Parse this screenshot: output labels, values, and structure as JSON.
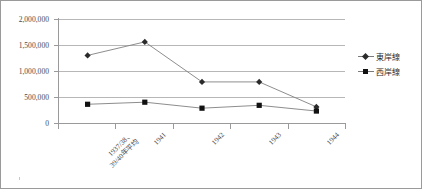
{
  "chart_data": {
    "type": "line",
    "title": "",
    "subtitle": "",
    "xlabel": "",
    "ylabel": "",
    "ylim": [
      0,
      2000000
    ],
    "grid": "horizontal",
    "legend_position": "right",
    "categories": [
      "1937/38、\n39/40年平均",
      "1941",
      "1942",
      "1943",
      "1944"
    ],
    "category_lines": [
      [
        "1937/38、",
        "39/40年平均"
      ],
      [
        "1941"
      ],
      [
        "1942"
      ],
      [
        "1943"
      ],
      [
        "1944"
      ]
    ],
    "ytick_labels": [
      "2,000,000",
      "1,500,000",
      "1,000,000",
      "500,000",
      "0"
    ],
    "ytick_values": [
      2000000,
      1500000,
      1000000,
      500000,
      0
    ],
    "series": [
      {
        "name": "東岸線",
        "marker": "diamond",
        "color": "#2b2b2b",
        "line_color": "#808080",
        "values": [
          1300000,
          1560000,
          790000,
          790000,
          310000
        ]
      },
      {
        "name": "西岸線",
        "marker": "square",
        "color": "#111111",
        "line_color": "#808080",
        "values": [
          360000,
          400000,
          285000,
          340000,
          230000
        ]
      }
    ]
  },
  "legend": {
    "entries": [
      {
        "label": "東岸線"
      },
      {
        "label": "西岸線"
      }
    ]
  },
  "colors": {
    "frame_border": "#9a9a9a",
    "gridline": "#b7b7b7",
    "axis": "#9a9a9a",
    "text": "#4a4a4a",
    "series_line": "#808080"
  }
}
